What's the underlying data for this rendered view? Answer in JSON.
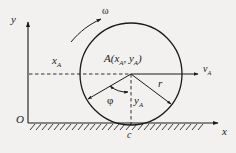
{
  "figure": {
    "kind": "mechanics-diagram",
    "background_color": "#f2f1ef",
    "stroke_color": "#1b1b1b"
  },
  "axes": {
    "y_label": "y",
    "x_label": "x",
    "origin_label": "O"
  },
  "labels": {
    "omega": "ω",
    "x_a": {
      "base": "x",
      "sub": "A"
    },
    "v_a": {
      "base": "v",
      "sub": "A"
    },
    "y_a": {
      "base": "y",
      "sub": "A"
    },
    "radius": "r",
    "phi": "φ",
    "contact_point": "c",
    "center_point": {
      "name": "A",
      "open_paren": "(",
      "coord_x_base": "x",
      "coord_x_sub": "A",
      "comma": ", ",
      "coord_y_base": "y",
      "coord_y_sub": "A",
      "close_paren": ")"
    }
  },
  "geometry": {
    "circle": {
      "cx": 131,
      "cy": 74,
      "r": 52
    },
    "ground_y": 123,
    "origin": {
      "x": 28,
      "y": 123
    }
  }
}
